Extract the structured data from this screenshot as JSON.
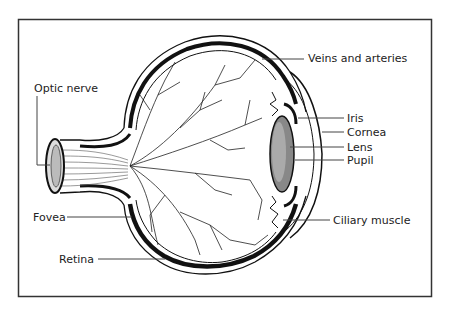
{
  "diagram": {
    "frame_color": "#333333",
    "ink_color": "#111111",
    "labels": {
      "optic_nerve": "Optic nerve",
      "veins_and_arteries": "Veins and arteries",
      "iris": "Iris",
      "cornea": "Cornea",
      "lens": "Lens",
      "pupil": "Pupil",
      "ciliary_muscle": "Ciliary muscle",
      "fovea": "Fovea",
      "retina": "Retina"
    }
  }
}
